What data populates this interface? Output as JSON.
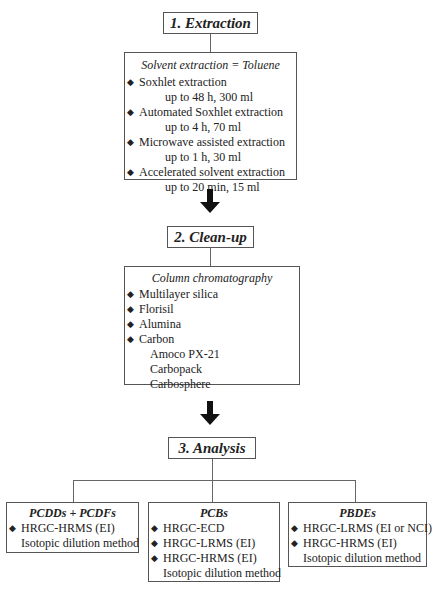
{
  "steps": [
    {
      "title": "1. Extraction",
      "panel": {
        "subtitle": "Solvent extraction = Toluene",
        "items": [
          {
            "label": "Soxhlet extraction",
            "detail": "up to 48 h, 300 ml"
          },
          {
            "label": "Automated Soxhlet extraction",
            "detail": "up to 4 h, 70 ml"
          },
          {
            "label": "Microwave assisted extraction",
            "detail": "up to 1 h, 30 ml"
          },
          {
            "label": "Accelerated solvent extraction",
            "detail": "up to 20 min, 15 ml"
          }
        ]
      }
    },
    {
      "title": "2. Clean-up",
      "panel": {
        "subtitle": "Column chromatography",
        "items": [
          {
            "label": "Multilayer silica"
          },
          {
            "label": "Florisil"
          },
          {
            "label": "Alumina"
          },
          {
            "label": "Carbon",
            "subitems": [
              "Amoco PX-21",
              "Carbopack",
              "Carbosphere"
            ]
          }
        ]
      }
    },
    {
      "title": "3. Analysis",
      "branches": [
        {
          "title": "PCDDs + PCDFs",
          "items": [
            "HRGC-HRMS (EI)"
          ],
          "note": "Isotopic dilution method"
        },
        {
          "title": "PCBs",
          "items": [
            "HRGC-ECD",
            "HRGC-LRMS (EI)",
            "HRGC-HRMS (EI)"
          ],
          "note": "Isotopic dilution method"
        },
        {
          "title": "PBDEs",
          "items": [
            "HRGC-LRMS (EI or NCI)",
            "HRGC-HRMS (EI)"
          ],
          "note": "Isotopic dilution method"
        }
      ]
    }
  ]
}
